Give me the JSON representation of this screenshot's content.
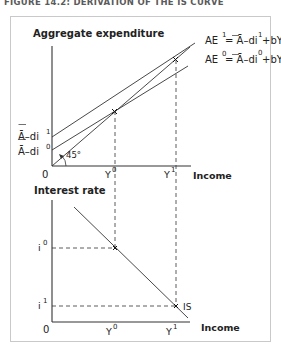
{
  "figure": {
    "title": "FIGURE 14.2:  DERIVATION OF THE IS CURVE"
  },
  "top_panel": {
    "y_axis_label": "Aggregate expenditure",
    "x_axis_label": "Income",
    "origin_label": "0",
    "angle_label": "45°",
    "intercepts": [
      {
        "name": "A-di1",
        "base": "Ā–di",
        "sup": "1"
      },
      {
        "name": "A-di0",
        "base": "Ā–di",
        "sup": "0"
      }
    ],
    "x_ticks": [
      {
        "base": "Y",
        "sup": "0"
      },
      {
        "base": "Y",
        "sup": "1"
      }
    ],
    "equations": [
      {
        "lhs": "AE",
        "lhs_sup": "1",
        "rhs_a": "= Ā–di",
        "rhs_sup": "1",
        "rhs_b": "+bY"
      },
      {
        "lhs": "AE",
        "lhs_sup": "0",
        "rhs_a": "= Ā–di",
        "rhs_sup": "0",
        "rhs_b": "+bY"
      }
    ]
  },
  "bottom_panel": {
    "y_axis_label": "Interest rate",
    "x_axis_label": "Income",
    "origin_label": "0",
    "curve_label": "IS",
    "y_ticks": [
      {
        "base": "i",
        "sup": "0"
      },
      {
        "base": "i",
        "sup": "1"
      }
    ],
    "x_ticks": [
      {
        "base": "Y",
        "sup": "0"
      },
      {
        "base": "Y",
        "sup": "1"
      }
    ]
  },
  "colors": {
    "line": "#333333",
    "frame": "#c9c9c9",
    "title": "#5a5a5a"
  }
}
